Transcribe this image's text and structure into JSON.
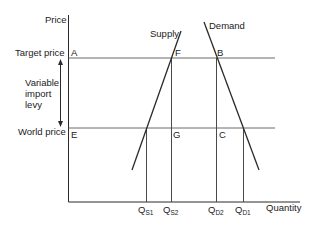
{
  "diagram": {
    "type": "supply-demand with variable import levy",
    "axes": {
      "y_label": "Price",
      "x_label": "Quantity"
    },
    "price_levels": {
      "target": "Target price",
      "world": "World price"
    },
    "levy_label_lines": [
      "Variable",
      "import",
      "levy"
    ],
    "curves": {
      "supply": "Supply",
      "demand": "Demand"
    },
    "points": {
      "A": "A",
      "B": "B",
      "C": "C",
      "E": "E",
      "F": "F",
      "G": "G"
    },
    "quantities": [
      {
        "main": "Q",
        "sub": "S1"
      },
      {
        "main": "Q",
        "sub": "S2"
      },
      {
        "main": "Q",
        "sub": "D2"
      },
      {
        "main": "Q",
        "sub": "D1"
      }
    ],
    "colors": {
      "line": "#2a2a2a",
      "guide": "#6a6a6a",
      "text": "#222222"
    }
  }
}
